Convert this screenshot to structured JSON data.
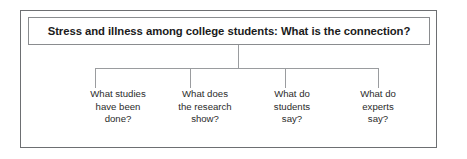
{
  "figure": {
    "root": {
      "text": "Stress and illness among college students: What is the connection?"
    },
    "branches": [
      {
        "id": "what-studies-have-been-done",
        "lines": [
          "What studies",
          "have been",
          "done?"
        ],
        "center_x": 118,
        "drop_x": 95
      },
      {
        "id": "what-does-the-research-show",
        "lines": [
          "What does",
          "the research",
          "show?"
        ],
        "center_x": 205,
        "drop_x": 190
      },
      {
        "id": "what-do-students-say",
        "lines": [
          "What do",
          "students",
          "say?"
        ],
        "center_x": 292,
        "drop_x": 285
      },
      {
        "id": "what-do-experts-say",
        "lines": [
          "What do",
          "experts",
          "say?"
        ],
        "center_x": 378,
        "drop_x": 378
      }
    ],
    "colors": {
      "frame_border": "#6d6f72",
      "box_border": "#8a8c8f",
      "connector": "#9a9c9f",
      "title_text": "#1b1b1b",
      "label_text": "#2b2b2b",
      "background": "#ffffff"
    }
  }
}
